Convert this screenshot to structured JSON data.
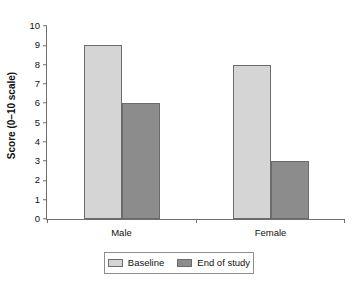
{
  "chart_data": {
    "type": "bar",
    "title": "",
    "xlabel": "",
    "ylabel": "Score (0–10 scale)",
    "categories": [
      "Male",
      "Female"
    ],
    "series": [
      {
        "name": "Baseline",
        "values": [
          9,
          8
        ],
        "color": "#d5d5d5"
      },
      {
        "name": "End of study",
        "values": [
          6,
          3
        ],
        "color": "#8c8c8c"
      }
    ],
    "ylim": [
      0,
      10
    ],
    "yticks": [
      10,
      9,
      8,
      7,
      6,
      5,
      4,
      3,
      2,
      1,
      0
    ],
    "grid": false,
    "legend_position": "bottom"
  },
  "legend": {
    "items": [
      {
        "label": "Baseline"
      },
      {
        "label": "End of study"
      }
    ]
  }
}
